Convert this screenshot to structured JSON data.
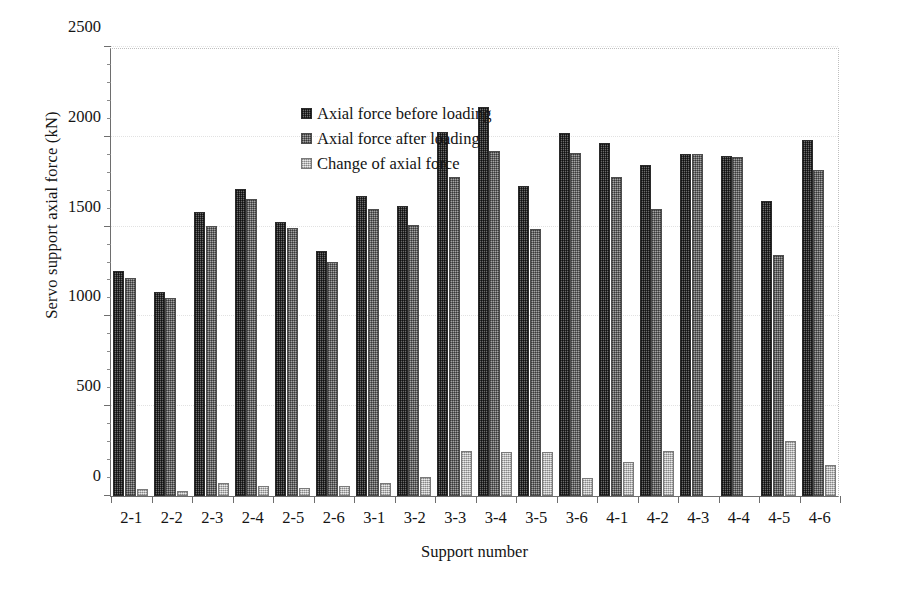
{
  "chart_data": {
    "type": "bar",
    "title": "",
    "xlabel": "Support number",
    "ylabel": "Servo support axial force (kN)",
    "ylim": [
      0,
      2500
    ],
    "yticks": [
      0,
      500,
      1000,
      1500,
      2000,
      2500
    ],
    "ytick_labels": [
      "0",
      "500",
      "1000",
      "1500",
      "2000",
      "2500"
    ],
    "minor_tick_step": 100,
    "grid": "horizontal-dotted",
    "legend_position": "top-center-inside",
    "categories": [
      "2-1",
      "2-2",
      "2-3",
      "2-4",
      "2-5",
      "2-6",
      "3-1",
      "3-2",
      "3-3",
      "3-4",
      "3-5",
      "3-6",
      "4-1",
      "4-2",
      "4-3",
      "4-4",
      "4-5",
      "4-6"
    ],
    "series": [
      {
        "name": "Axial force before loading",
        "color": "#4a4a4a",
        "values": [
          1255,
          1135,
          1580,
          1710,
          1525,
          1365,
          1670,
          1615,
          2025,
          2165,
          1725,
          2020,
          1965,
          1845,
          1905,
          1895,
          1645,
          1985
        ]
      },
      {
        "name": "Axial force after loading",
        "color": "#7d7d7d",
        "values": [
          1215,
          1105,
          1505,
          1655,
          1490,
          1305,
          1600,
          1510,
          1775,
          1920,
          1485,
          1910,
          1775,
          1600,
          1905,
          1890,
          1340,
          1815
        ]
      },
      {
        "name": "Change of axial force",
        "color": "#c9c9c9",
        "values": [
          40,
          30,
          75,
          55,
          45,
          55,
          70,
          105,
          250,
          245,
          245,
          100,
          190,
          250,
          0,
          0,
          305,
          170
        ]
      }
    ]
  },
  "legend": {
    "items": [
      {
        "label": "Axial force before loading",
        "swatch": "series-1-swatch"
      },
      {
        "label": "Axial force after loading",
        "swatch": "series-2-swatch"
      },
      {
        "label": "Change of axial force",
        "swatch": "series-3-swatch"
      }
    ]
  },
  "axes": {
    "y_title": "Servo support axial force (kN)",
    "x_title": "Support number"
  }
}
